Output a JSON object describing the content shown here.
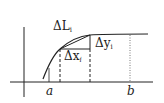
{
  "diagram": {
    "labels": {
      "delta_L": "ΔL",
      "delta_L_sub": "i",
      "delta_x": "Δx",
      "delta_x_sub": "i",
      "delta_y": "Δy",
      "delta_y_sub": "i",
      "a": "a",
      "b": "b"
    },
    "colors": {
      "line": "#222222",
      "background": "#ffffff"
    }
  }
}
